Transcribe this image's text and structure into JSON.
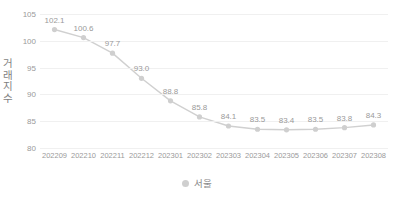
{
  "chart_data": {
    "type": "line",
    "title": "",
    "xlabel": "",
    "ylabel": "거래지수",
    "ylim": [
      80,
      105
    ],
    "yticks": [
      105,
      100,
      95,
      90,
      85,
      80
    ],
    "grid": true,
    "legend_position": "bottom",
    "categories": [
      "202209",
      "202210",
      "202211",
      "202212",
      "202301",
      "202302",
      "202303",
      "202304",
      "202305",
      "202306",
      "202307",
      "202308"
    ],
    "series": [
      {
        "name": "서울",
        "color": "#d0d0d0",
        "marker_color": "#cfcfcf",
        "values": [
          102.1,
          100.6,
          97.7,
          93.0,
          88.8,
          85.8,
          84.1,
          83.5,
          83.4,
          83.5,
          83.8,
          84.3
        ],
        "data_labels": [
          "102.1",
          "100.6",
          "97.7",
          "93.0",
          "88.8",
          "85.8",
          "84.1",
          "83.5",
          "83.4",
          "83.5",
          "83.8",
          "84.3"
        ]
      }
    ]
  },
  "legend": {
    "swatch_icon": "legend-dot-icon",
    "entries": [
      {
        "label": "서울"
      }
    ]
  },
  "axis": {
    "y_title": "거래지수",
    "y_tick_labels": [
      "105",
      "100",
      "95",
      "90",
      "85",
      "80"
    ],
    "x_tick_labels": [
      "202209",
      "202210",
      "202211",
      "202212",
      "202301",
      "202302",
      "202303",
      "202304",
      "202305",
      "202306",
      "202307",
      "202308"
    ]
  },
  "colors": {
    "gridline": "#f0f0f0",
    "line": "#d0d0d0",
    "marker": "#cfcfcf",
    "tick_text": "#9a9a9a",
    "axis_title_text": "#7f7f7f",
    "background": "#ffffff"
  }
}
